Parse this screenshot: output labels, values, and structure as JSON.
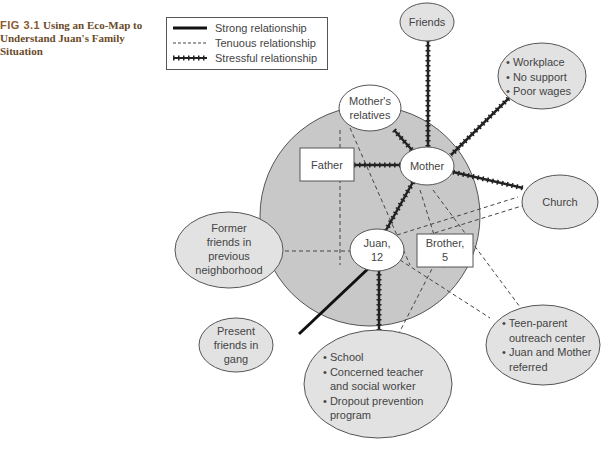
{
  "caption": {
    "fig_label": "FIG 3.1",
    "title": "Using an Eco-Map to Understand Juan's Family Situation"
  },
  "legend": {
    "strong": "Strong relationship",
    "tenuous": "Tenuous relationship",
    "stressful": "Stressful relationship"
  },
  "colors": {
    "family_circle": "#c8c8c8",
    "external_node": "#e2e2e2",
    "internal_node": "#ffffff",
    "line": "#222222"
  },
  "nodes": {
    "friends": "Friends",
    "workplace": [
      "Workplace",
      "No support",
      "Poor wages"
    ],
    "mothers_relatives": [
      "Mother's",
      "relatives"
    ],
    "father": "Father",
    "mother": "Mother",
    "church": "Church",
    "former_friends": [
      "Former",
      "friends in",
      "previous",
      "neighborhood"
    ],
    "juan": [
      "Juan,",
      "12"
    ],
    "brother": [
      "Brother,",
      "5"
    ],
    "present_friends": [
      "Present",
      "friends in",
      "gang"
    ],
    "teen_parent": [
      "Teen-parent",
      "outreach center",
      "Juan and Mother",
      "referred"
    ],
    "school": [
      "School",
      "Concerned teacher",
      "and social worker",
      "Dropout prevention",
      "program"
    ]
  }
}
